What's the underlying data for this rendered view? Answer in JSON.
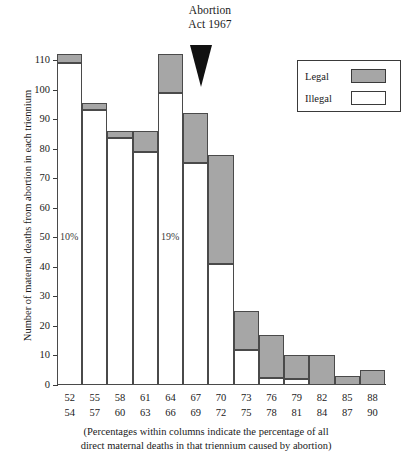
{
  "annotation": {
    "line1": "Abortion",
    "line2": "Act 1967",
    "marker": "down-triangle"
  },
  "legend": {
    "title": "",
    "position": "top-right",
    "items": [
      {
        "label": "Legal",
        "color": "#a6a6a6"
      },
      {
        "label": "Illegal",
        "color": "#ffffff"
      }
    ]
  },
  "caption": {
    "line1": "(Percentages within columns indicate the percentage of all",
    "line2": "direct maternal deaths in that triennium caused by abortion)"
  },
  "chart_data": {
    "type": "bar",
    "title": "",
    "subtitle": "",
    "xlabel": "",
    "ylabel": "Number of maternal deaths from abortion in each triennium",
    "ylim": [
      0,
      110
    ],
    "yticks": [
      0,
      10,
      20,
      30,
      40,
      50,
      60,
      70,
      80,
      90,
      100,
      110
    ],
    "grid": false,
    "stacked": true,
    "legend_position": "top-right",
    "categories": [
      "52\n54",
      "55\n57",
      "58\n60",
      "61\n63",
      "64\n66",
      "67\n69",
      "70\n72",
      "73\n75",
      "76\n78",
      "79\n81",
      "82\n84",
      "85\n87",
      "88\n90"
    ],
    "category_top": [
      "52",
      "55",
      "58",
      "61",
      "64",
      "67",
      "70",
      "73",
      "76",
      "79",
      "82",
      "85",
      "88"
    ],
    "category_bottom": [
      "54",
      "57",
      "60",
      "63",
      "66",
      "69",
      "72",
      "75",
      "78",
      "81",
      "84",
      "87",
      "90"
    ],
    "series": [
      {
        "name": "Illegal",
        "color": "#ffffff",
        "values": [
          109,
          93,
          83.5,
          79,
          99,
          75,
          41,
          12,
          2.5,
          2,
          0,
          0,
          0
        ]
      },
      {
        "name": "Legal",
        "color": "#a6a6a6",
        "values": [
          3,
          2.5,
          2.5,
          7,
          13,
          17,
          37,
          13,
          14.5,
          8,
          10,
          3,
          5
        ]
      }
    ],
    "totals": [
      112,
      95.5,
      86,
      86,
      112,
      92,
      78,
      25,
      17,
      10,
      10,
      3,
      5
    ],
    "annotations": [
      {
        "text": "10%",
        "category": "52\n54",
        "value": 52
      },
      {
        "text": "19%",
        "category": "64\n66",
        "value": 52
      }
    ]
  }
}
